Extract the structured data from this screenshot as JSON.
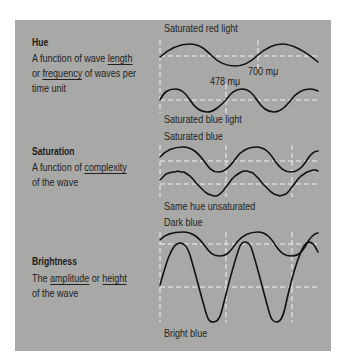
{
  "sections": {
    "hue": {
      "heading": "Hue",
      "desc_line1_pre": "A function of wave ",
      "desc_line1_u": "length",
      "desc_line2_pre": "or ",
      "desc_line2_u": "frequency",
      "desc_line2_post": " of waves per",
      "desc_line3": "time unit"
    },
    "saturation": {
      "heading": "Saturation",
      "desc_line1_pre": "A function of ",
      "desc_line1_u": "complexity",
      "desc_line2": "of the wave"
    },
    "brightness": {
      "heading": "Brightness",
      "desc_line1_pre": "The ",
      "desc_line1_u1": "amplitude",
      "desc_line1_mid": " or ",
      "desc_line1_u2": "height",
      "desc_line2": "of the wave"
    }
  },
  "wave_labels": {
    "red": "Saturated red light",
    "red_wavelength": "700 mμ",
    "blue_wavelength": "478 mμ",
    "blue": "Saturated blue light",
    "sat_blue": "Saturated blue",
    "unsaturated": "Same hue unsaturated",
    "dark_blue": "Dark blue",
    "bright_blue": "Bright blue"
  },
  "colors": {
    "panel": "#a8a8a6",
    "wave": "#111111",
    "dash": "#f2f2f2"
  }
}
